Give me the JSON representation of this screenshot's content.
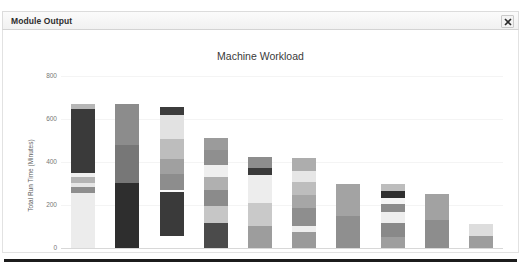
{
  "window": {
    "title": "Module Output",
    "close_icon": "close-icon",
    "close_label": "×"
  },
  "chart_data": {
    "type": "bar",
    "subtype": "stacked-bar",
    "title": "Machine Workload",
    "xlabel": "",
    "ylabel": "Total Run Time (Minutes)",
    "ylim": [
      0,
      800
    ],
    "yticks": [
      0,
      200,
      400,
      600,
      800
    ],
    "grid": true,
    "legend": "none",
    "categories": [
      "M1",
      "M2",
      "M3",
      "M4",
      "M5",
      "M6",
      "M7",
      "M8",
      "M9",
      "M10"
    ],
    "bar_totals": [
      672,
      670,
      655,
      512,
      423,
      420,
      298,
      297,
      253,
      112
    ],
    "bars": [
      {
        "category": "M1",
        "total": 672,
        "segments": [
          {
            "value": 256,
            "color": "#ececec"
          },
          {
            "value": 28,
            "color": "#8e8e8e"
          },
          {
            "value": 18,
            "color": "#e6e6e6"
          },
          {
            "value": 26,
            "color": "#b4b4b4"
          },
          {
            "value": 20,
            "color": "#f0f0f0"
          },
          {
            "value": 300,
            "color": "#3a3a3a"
          },
          {
            "value": 24,
            "color": "#b6b6b6"
          }
        ]
      },
      {
        "category": "M2",
        "total": 670,
        "segments": [
          {
            "value": 300,
            "color": "#2e2e2e"
          },
          {
            "value": 180,
            "color": "#777777"
          },
          {
            "value": 190,
            "color": "#8c8c8c"
          }
        ]
      },
      {
        "category": "M3",
        "total": 655,
        "segments": [
          {
            "value": 205,
            "color": "#3a3a3a"
          },
          {
            "value": 12,
            "color": "#fbfbfb"
          },
          {
            "value": 70,
            "color": "#8d8d8d"
          },
          {
            "value": 72,
            "color": "#a0a0a0"
          },
          {
            "value": 95,
            "color": "#bdbdbd"
          },
          {
            "value": 110,
            "color": "#e2e2e2"
          },
          {
            "value": 36,
            "color": "#3c3c3c"
          }
        ]
      },
      {
        "category": "M4",
        "total": 512,
        "segments": [
          {
            "value": 118,
            "color": "#4b4b4b"
          },
          {
            "value": 78,
            "color": "#c6c6c6"
          },
          {
            "value": 72,
            "color": "#8b8b8b"
          },
          {
            "value": 60,
            "color": "#b0b0b0"
          },
          {
            "value": 60,
            "color": "#efefef"
          },
          {
            "value": 66,
            "color": "#8f8f8f"
          },
          {
            "value": 58,
            "color": "#9b9b9b"
          }
        ]
      },
      {
        "category": "M5",
        "total": 423,
        "segments": [
          {
            "value": 100,
            "color": "#9d9d9d"
          },
          {
            "value": 110,
            "color": "#c9c9c9"
          },
          {
            "value": 130,
            "color": "#ededed"
          },
          {
            "value": 30,
            "color": "#3a3a3a"
          },
          {
            "value": 53,
            "color": "#8d8d8d"
          }
        ]
      },
      {
        "category": "M6",
        "total": 420,
        "segments": [
          {
            "value": 72,
            "color": "#9a9a9a"
          },
          {
            "value": 30,
            "color": "#ededed"
          },
          {
            "value": 84,
            "color": "#8e8e8e"
          },
          {
            "value": 60,
            "color": "#a6a6a6"
          },
          {
            "value": 60,
            "color": "#bdbdbd"
          },
          {
            "value": 52,
            "color": "#e6e6e6"
          },
          {
            "value": 62,
            "color": "#adadad"
          }
        ]
      },
      {
        "category": "M7",
        "total": 298,
        "segments": [
          {
            "value": 150,
            "color": "#8f8f8f"
          },
          {
            "value": 148,
            "color": "#a3a3a3"
          }
        ]
      },
      {
        "category": "M8",
        "total": 297,
        "segments": [
          {
            "value": 52,
            "color": "#9e9e9e"
          },
          {
            "value": 62,
            "color": "#898989"
          },
          {
            "value": 54,
            "color": "#eeeeee"
          },
          {
            "value": 36,
            "color": "#8b8b8b"
          },
          {
            "value": 28,
            "color": "#f4f4f4"
          },
          {
            "value": 32,
            "color": "#2f2f2f"
          },
          {
            "value": 33,
            "color": "#bdbdbd"
          }
        ]
      },
      {
        "category": "M9",
        "total": 253,
        "segments": [
          {
            "value": 130,
            "color": "#8d8d8d"
          },
          {
            "value": 123,
            "color": "#a2a2a2"
          }
        ]
      },
      {
        "category": "M10",
        "total": 112,
        "segments": [
          {
            "value": 55,
            "color": "#9d9d9d"
          },
          {
            "value": 57,
            "color": "#dddddd"
          }
        ]
      }
    ]
  }
}
